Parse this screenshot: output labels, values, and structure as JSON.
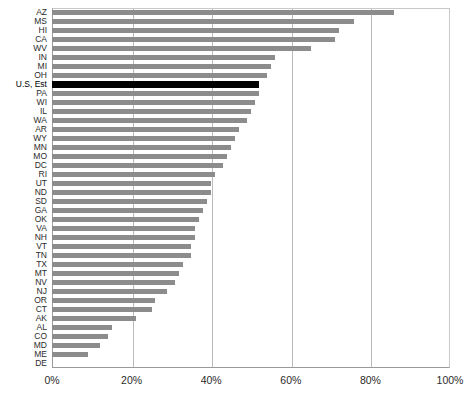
{
  "chart_data": {
    "type": "bar",
    "orientation": "horizontal",
    "title": "",
    "subtitle": "",
    "xlabel": "",
    "ylabel": "",
    "xlim": [
      0,
      100
    ],
    "xtick_labels": [
      "0%",
      "20%",
      "40%",
      "60%",
      "80%",
      "100%"
    ],
    "xtick_values": [
      0,
      20,
      40,
      60,
      80,
      100
    ],
    "grid": true,
    "legend": false,
    "bar_color": "#8c8c8c",
    "highlight_color": "#000000",
    "highlight_category": "U.S, Est",
    "categories": [
      "AZ",
      "MS",
      "HI",
      "CA",
      "WV",
      "IN",
      "MI",
      "OH",
      "U.S, Est",
      "PA",
      "WI",
      "IL",
      "WA",
      "AR",
      "WY",
      "MN",
      "MO",
      "DC",
      "RI",
      "UT",
      "ND",
      "SD",
      "GA",
      "OK",
      "VA",
      "NH",
      "VT",
      "TN",
      "TX",
      "MT",
      "NV",
      "NJ",
      "OR",
      "CT",
      "AK",
      "AL",
      "CO",
      "MD",
      "ME",
      "DE"
    ],
    "values": [
      86,
      76,
      72,
      71,
      65,
      56,
      55,
      54,
      52,
      52,
      51,
      50,
      49,
      47,
      46,
      45,
      44,
      43,
      41,
      40,
      40,
      39,
      38,
      37,
      36,
      36,
      35,
      35,
      33,
      32,
      31,
      29,
      26,
      25,
      21,
      15,
      14,
      12,
      9,
      0
    ]
  }
}
